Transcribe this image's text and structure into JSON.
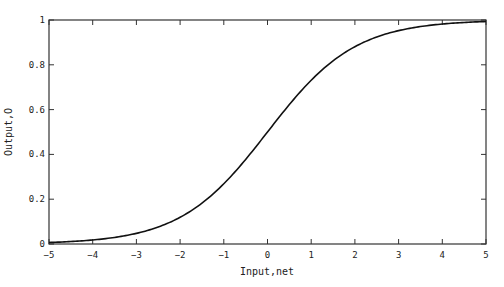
{
  "chart_data": {
    "type": "line",
    "title": "",
    "xlabel": "Input,net",
    "ylabel": "Output,O",
    "xlim": [
      -5,
      5
    ],
    "ylim": [
      0,
      1
    ],
    "grid": false,
    "legend": null,
    "x_ticks": [
      "-5",
      "-4",
      "-3",
      "-2",
      "-1",
      "0",
      "1",
      "2",
      "3",
      "4",
      "5"
    ],
    "y_ticks": [
      "0",
      "0.2",
      "0.4",
      "0.6",
      "0.8",
      "1"
    ],
    "series": [
      {
        "name": "sigmoid",
        "function": "1/(1+exp(-net))",
        "x": [
          -5,
          -4,
          -3,
          -2,
          -1,
          0,
          1,
          2,
          3,
          4,
          5
        ],
        "values": [
          0.007,
          0.018,
          0.047,
          0.119,
          0.269,
          0.5,
          0.731,
          0.881,
          0.953,
          0.982,
          0.993
        ]
      }
    ]
  }
}
